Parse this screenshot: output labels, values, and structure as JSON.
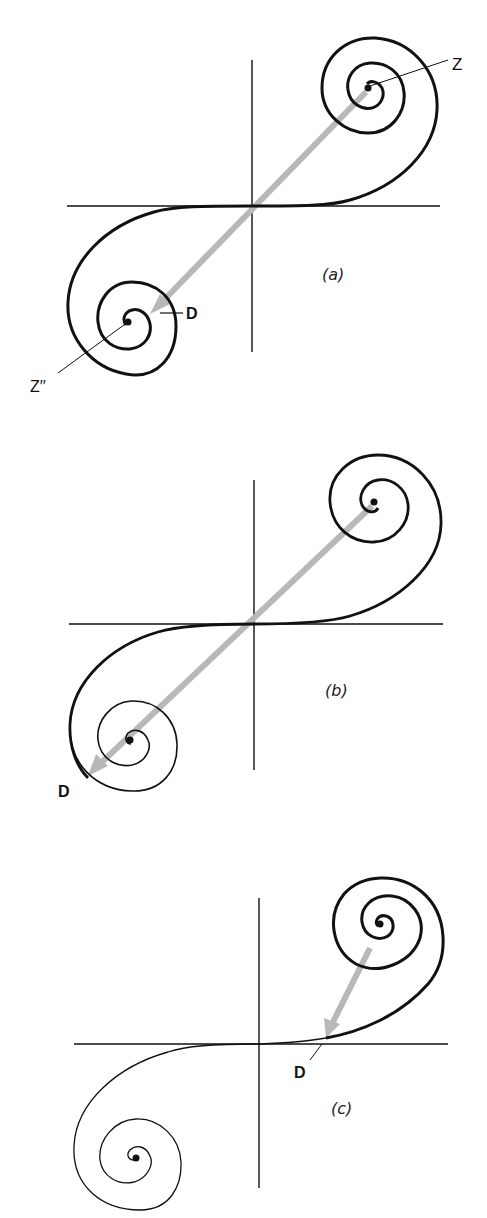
{
  "figure": {
    "type": "cornu-spiral-diagram",
    "colors": {
      "ink": "#111111",
      "phasor": "#b8b8b8",
      "background": "#ffffff"
    },
    "panels": [
      {
        "id": "a",
        "caption": "(a)",
        "origin": [
          252,
          206
        ],
        "h_axis": [
          67,
          440
        ],
        "v_axis": [
          60,
          352
        ],
        "upper_eye": [
          368,
          88
        ],
        "lower_eye": [
          128,
          322
        ],
        "labels": [
          {
            "text": "Z",
            "x": 452,
            "y": 72
          },
          {
            "text": "D",
            "x": 190,
            "y": 320
          },
          {
            "text": "Z′′",
            "x": 30,
            "y": 388
          }
        ],
        "phasor": {
          "from": [
            368,
            88
          ],
          "to": [
            160,
            304
          ],
          "note": "arrow from Z toward D"
        }
      },
      {
        "id": "b",
        "caption": "(b)",
        "origin": [
          254,
          624
        ],
        "h_axis": [
          69,
          443
        ],
        "v_axis": [
          480,
          770
        ],
        "upper_eye": [
          374,
          502
        ],
        "lower_eye": [
          130,
          740
        ],
        "labels": [
          {
            "text": "D",
            "x": 60,
            "y": 796
          }
        ],
        "phasor": {
          "from": [
            374,
            502
          ],
          "to": [
            92,
            772
          ],
          "note": "arrow from upper eye to D"
        }
      },
      {
        "id": "c",
        "caption": "(c)",
        "origin": [
          259,
          1044
        ],
        "h_axis": [
          74,
          448
        ],
        "v_axis": [
          898,
          1188
        ],
        "upper_eye": [
          380,
          924
        ],
        "lower_eye": [
          136,
          1158
        ],
        "labels": [
          {
            "text": "D",
            "x": 294,
            "y": 1076
          }
        ],
        "phasor": {
          "from": [
            372,
            944
          ],
          "to": [
            326,
            1034
          ],
          "note": "short arrow from upper eye to D"
        }
      }
    ]
  },
  "captions": {
    "a": "(a)",
    "b": "(b)",
    "c": "(c)"
  },
  "labels": {
    "z_top": "Z",
    "d_a": "D",
    "z_bottom": "Z′′",
    "d_b": "D",
    "d_c": "D"
  }
}
